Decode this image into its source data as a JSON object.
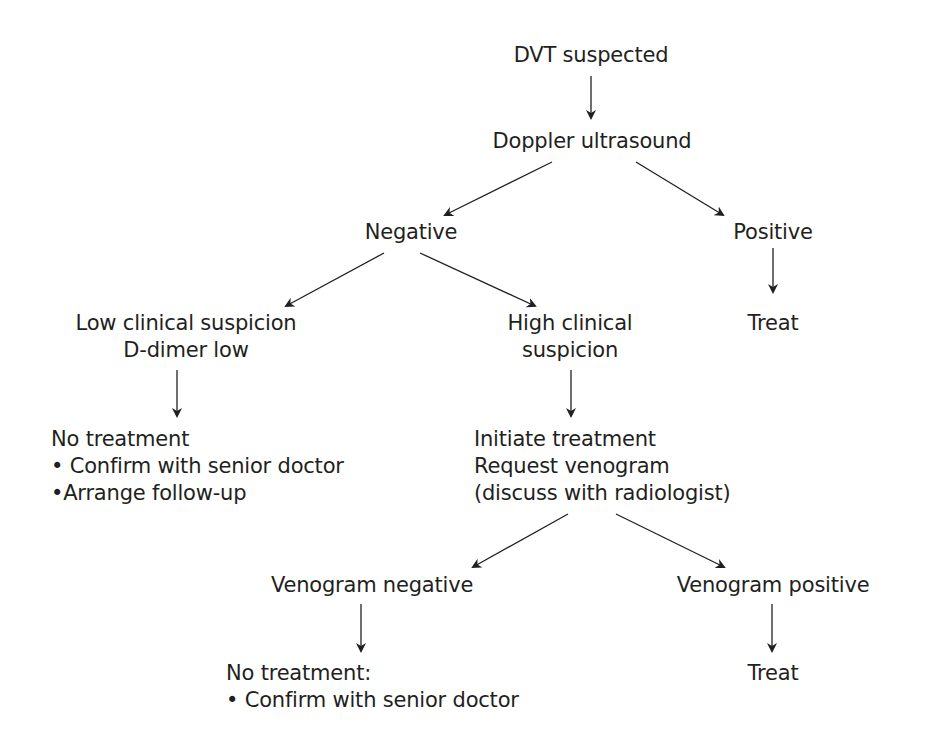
{
  "diagram": {
    "type": "flowchart",
    "title": "DVT suspected",
    "nodes": {
      "dvt_suspected": "DVT suspected",
      "doppler": "Doppler ultrasound",
      "negative": "Negative",
      "positive": "Positive",
      "treat_1": "Treat",
      "low_suspicion": [
        "Low clinical suspicion",
        "D-dimer low"
      ],
      "high_suspicion": [
        "High clinical",
        "suspicion"
      ],
      "no_treatment_1": [
        "No treatment",
        "• Confirm with senior doctor",
        "•Arrange follow-up"
      ],
      "initiate": [
        "Initiate treatment",
        "Request venogram",
        "(discuss with radiologist)"
      ],
      "venogram_negative": "Venogram negative",
      "venogram_positive": "Venogram positive",
      "no_treatment_2": [
        "No treatment:",
        "• Confirm with senior doctor"
      ],
      "treat_2": "Treat"
    },
    "edges": [
      [
        "dvt_suspected",
        "doppler"
      ],
      [
        "doppler",
        "negative"
      ],
      [
        "doppler",
        "positive"
      ],
      [
        "positive",
        "treat_1"
      ],
      [
        "negative",
        "low_suspicion"
      ],
      [
        "negative",
        "high_suspicion"
      ],
      [
        "low_suspicion",
        "no_treatment_1"
      ],
      [
        "high_suspicion",
        "initiate"
      ],
      [
        "initiate",
        "venogram_negative"
      ],
      [
        "initiate",
        "venogram_positive"
      ],
      [
        "venogram_negative",
        "no_treatment_2"
      ],
      [
        "venogram_positive",
        "treat_2"
      ]
    ],
    "colors": {
      "text": "#231f20",
      "arrow": "#231f20",
      "background": "#ffffff"
    }
  }
}
